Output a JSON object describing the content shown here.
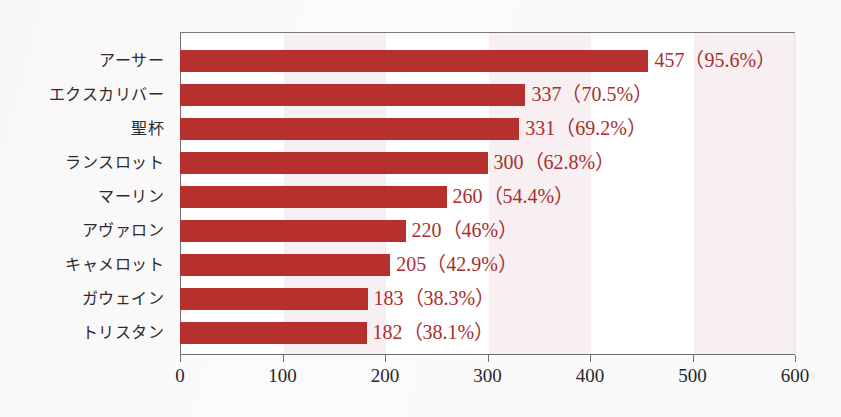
{
  "chart_data": {
    "type": "bar",
    "orientation": "horizontal",
    "title": "",
    "xlabel": "",
    "ylabel": "",
    "xlim": [
      0,
      600
    ],
    "ylim": null,
    "grid": false,
    "legend": null,
    "x_ticks": [
      0,
      100,
      200,
      300,
      400,
      500,
      600
    ],
    "x_tick_labels": [
      "0",
      "100",
      "200",
      "300",
      "400",
      "500",
      "600"
    ],
    "categories": [
      "アーサー",
      "エクスカリバー",
      "聖杯",
      "ランスロット",
      "マーリン",
      "アヴァロン",
      "キャメロット",
      "ガウェイン",
      "トリスタン"
    ],
    "values": [
      457,
      337,
      331,
      300,
      260,
      220,
      205,
      183,
      182
    ],
    "percents": [
      "95.6%",
      "70.5%",
      "69.2%",
      "62.8%",
      "54.4%",
      "46%",
      "42.9%",
      "38.3%",
      "38.1%"
    ],
    "data_labels": [
      "457（95.6%）",
      "337（70.5%）",
      "331（69.2%）",
      "300（62.8%）",
      "260（54.4%）",
      "220（46%）",
      "205（42.9%）",
      "183（38.3%）",
      "182（38.1%）"
    ],
    "bar_color": "#b6312e",
    "label_color": "#a82f2d",
    "band_color": "#f6eef0",
    "plot_background": "#ffffff",
    "page_background": "#fbfafa",
    "shaded_bands": [
      [
        100,
        200
      ],
      [
        300,
        400
      ],
      [
        500,
        600
      ]
    ]
  }
}
